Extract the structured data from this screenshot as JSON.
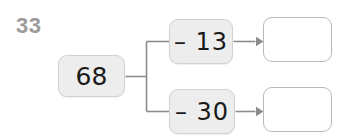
{
  "worksheet": {
    "problem_number": "33",
    "background_color": "#ffffff",
    "line_color": "#8c8c8c",
    "filled_box_color": "#ededed",
    "filled_box_border": "#d2d2d2",
    "empty_box_border": "#b9b9b9",
    "number_color": "#9b9b9b",
    "text_color": "#1a1a1a"
  },
  "diagram": {
    "start_value": "68",
    "branches": [
      {
        "operation": "– 13",
        "operation_symbol": "–",
        "operand": "13",
        "answer": ""
      },
      {
        "operation": "– 30",
        "operation_symbol": "–",
        "operand": "30",
        "answer": ""
      }
    ]
  }
}
